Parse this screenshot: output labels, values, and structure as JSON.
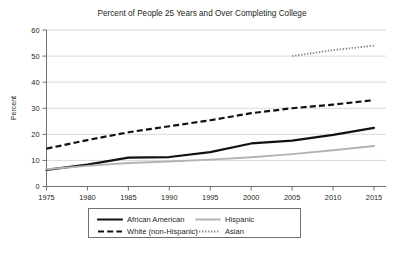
{
  "chart_data": {
    "type": "line",
    "title": "Percent of People 25 Years and Over Completing College",
    "xlabel": "",
    "ylabel": "Percent",
    "xlim": [
      1975,
      2015
    ],
    "ylim": [
      0,
      60
    ],
    "ytick_step": 10,
    "xtick_step": 5,
    "grid": true,
    "legend_position": "bottom-outside",
    "xticks": [
      "1975",
      "1980",
      "1985",
      "1990",
      "1995",
      "2000",
      "2005",
      "2010",
      "2015"
    ],
    "yticks": [
      "0",
      "10",
      "20",
      "30",
      "40",
      "50",
      "60"
    ],
    "x": [
      1975,
      1980,
      1985,
      1990,
      1995,
      2000,
      2005,
      2010,
      2015
    ],
    "series": [
      {
        "name": "African American",
        "style": "solid-thick",
        "color": "#111111",
        "x": [
          1975,
          1980,
          1985,
          1990,
          1995,
          2000,
          2005,
          2010,
          2015
        ],
        "values": [
          6.4,
          8.4,
          11.1,
          11.3,
          13.2,
          16.5,
          17.6,
          19.8,
          22.5
        ]
      },
      {
        "name": "White (non-Hispanic)",
        "style": "dashed",
        "color": "#111111",
        "x": [
          1975,
          1980,
          1985,
          1990,
          1995,
          2000,
          2005,
          2010,
          2015
        ],
        "values": [
          14.5,
          17.8,
          20.8,
          23.1,
          25.4,
          28.1,
          30.0,
          31.4,
          33.1
        ]
      },
      {
        "name": "Hispanic",
        "style": "solid-light",
        "color": "#b3b3b3",
        "x": [
          1975,
          1980,
          1985,
          1990,
          1995,
          2000,
          2005,
          2010,
          2015
        ],
        "values": [
          6.6,
          7.9,
          9.0,
          9.6,
          10.3,
          11.2,
          12.4,
          13.9,
          15.5
        ]
      },
      {
        "name": "Asian",
        "style": "dotted",
        "color": "#8c8c8c",
        "x": [
          2005,
          2010,
          2015
        ],
        "values": [
          50.0,
          52.3,
          54.0
        ]
      }
    ]
  },
  "legend": {
    "entries": [
      {
        "label": "African American",
        "style": "solid-thick"
      },
      {
        "label": "Hispanic",
        "style": "solid-light"
      },
      {
        "label": "White (non-Hispanic)",
        "style": "dashed"
      },
      {
        "label": "Asian",
        "style": "dotted"
      }
    ]
  },
  "colors": {
    "grid": "#c9c9c9",
    "axis": "#6f6f6f",
    "text": "#231f20",
    "dark_series": "#111111",
    "light_series": "#b3b3b3",
    "dotted_series": "#8c8c8c",
    "background": "#ffffff"
  }
}
